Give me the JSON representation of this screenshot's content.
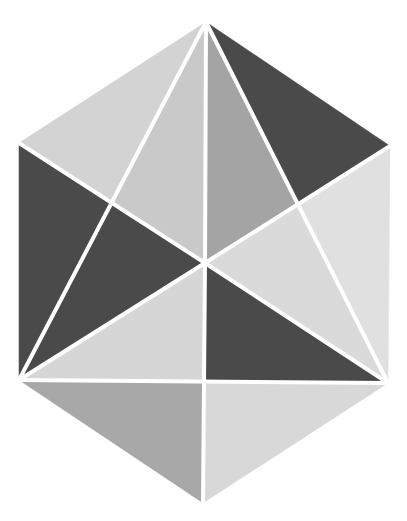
{
  "figure": {
    "title": "Hexagon subdivided into triangles",
    "width": 407,
    "height": 521,
    "background": "#ffffff",
    "stroke_color": "#ffffff",
    "stroke_width": 4
  },
  "colors": {
    "dark": "#4a4a4a",
    "mid": "#a6a6a6",
    "light": "#d3d3d3",
    "lighter": "#dcdcdc",
    "lightest": "#e0e0e0",
    "light_alt": "#c9c9c9"
  },
  "vertices": {
    "top": [
      206,
      22
    ],
    "upper_left": [
      19,
      143
    ],
    "upper_right": [
      390,
      146
    ],
    "lower_left": [
      19,
      380
    ],
    "lower_right": [
      388,
      383
    ],
    "bottom": [
      203,
      503
    ],
    "center": [
      205,
      263
    ],
    "left_intersection": [
      111,
      204
    ],
    "right_intersection": [
      299,
      205
    ],
    "bottom_mid": [
      204,
      381
    ]
  },
  "regions": [
    {
      "name": "top-left-outer",
      "points": "206,22 19,143 111,204",
      "fill": "#d3d3d3"
    },
    {
      "name": "top-left-inner",
      "points": "206,22 111,204 205,263",
      "fill": "#c9c9c9"
    },
    {
      "name": "top-right-inner",
      "points": "206,22 205,263 299,205",
      "fill": "#a4a4a4"
    },
    {
      "name": "top-right-outer",
      "points": "206,22 299,205 390,146",
      "fill": "#4a4a4a"
    },
    {
      "name": "left-outer",
      "points": "19,143 19,380 111,204",
      "fill": "#4a4a4a"
    },
    {
      "name": "left-inner",
      "points": "111,204 19,380 205,263",
      "fill": "#4a4a4a"
    },
    {
      "name": "right-inner",
      "points": "299,205 205,263 388,383",
      "fill": "#dadada"
    },
    {
      "name": "right-outer",
      "points": "390,146 299,205 388,383",
      "fill": "#e0e0e0"
    },
    {
      "name": "center-left-lower",
      "points": "205,263 19,380 204,381",
      "fill": "#d6d6d6"
    },
    {
      "name": "center-right-lower",
      "points": "205,263 204,381 388,383",
      "fill": "#4a4a4a"
    },
    {
      "name": "bottom-left",
      "points": "19,380 204,381 203,503",
      "fill": "#a8a8a8"
    },
    {
      "name": "bottom-right",
      "points": "204,381 388,383 203,503",
      "fill": "#d8d8d8"
    }
  ],
  "lines": [
    {
      "name": "vertical-top-center",
      "x1": 206,
      "y1": 22,
      "x2": 205,
      "y2": 263
    },
    {
      "name": "vertical-center-bottom",
      "x1": 205,
      "y1": 263,
      "x2": 203,
      "y2": 503
    },
    {
      "name": "diagonal-ul-lr",
      "x1": 19,
      "y1": 143,
      "x2": 205,
      "y2": 263
    },
    {
      "name": "diagonal-c-lr",
      "x1": 205,
      "y1": 263,
      "x2": 388,
      "y2": 383
    },
    {
      "name": "diagonal-ur-c",
      "x1": 390,
      "y1": 146,
      "x2": 205,
      "y2": 263
    },
    {
      "name": "diagonal-c-ll",
      "x1": 205,
      "y1": 263,
      "x2": 19,
      "y2": 380
    },
    {
      "name": "line-top-ll",
      "x1": 206,
      "y1": 22,
      "x2": 19,
      "y2": 380
    },
    {
      "name": "line-top-lr",
      "x1": 206,
      "y1": 22,
      "x2": 388,
      "y2": 383
    },
    {
      "name": "horizontal-ll-lr",
      "x1": 19,
      "y1": 380,
      "x2": 388,
      "y2": 383
    }
  ]
}
